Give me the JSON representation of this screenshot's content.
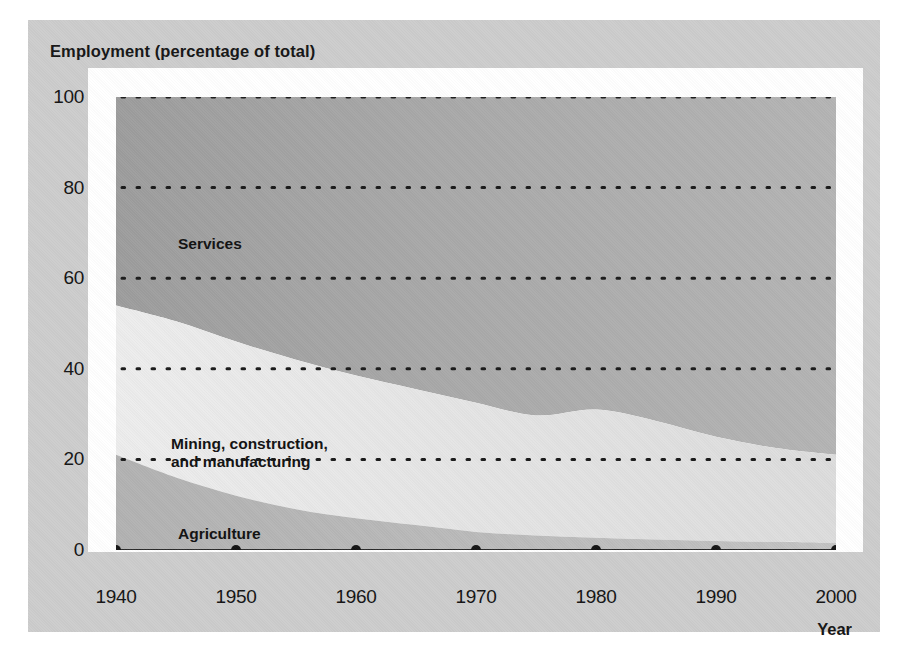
{
  "figure": {
    "y_axis_title": "Employment (percentage of total)",
    "x_axis_title": "Year"
  },
  "labels": {
    "services": "Services",
    "mining": "Mining, construction,\nand manufacturing",
    "agriculture": "Agriculture"
  },
  "colors": {
    "panel_background": "#cdcdcd",
    "plot_background": "#ffffff",
    "services_fill": "#a8a8a8",
    "mining_fill": "#e6e6e6",
    "agriculture_fill": "#bdbdbd",
    "gridline": "#1a1a1a",
    "text": "#141414"
  },
  "chart_data": {
    "type": "area",
    "stacked": true,
    "title": "",
    "xlabel": "Year",
    "ylabel": "Employment (percentage of total)",
    "xlim": [
      1940,
      2000
    ],
    "ylim": [
      0,
      100
    ],
    "grid": true,
    "legend_position": "inline-labels",
    "x": [
      1940,
      1945,
      1950,
      1955,
      1960,
      1965,
      1970,
      1975,
      1980,
      1985,
      1990,
      1995,
      2000
    ],
    "xticks": [
      1940,
      1950,
      1960,
      1970,
      1980,
      1990,
      2000
    ],
    "yticks": [
      0,
      20,
      40,
      60,
      80,
      100
    ],
    "series": [
      {
        "name": "Agriculture",
        "values": [
          21,
          16,
          12,
          9,
          7,
          5.5,
          4,
          3.2,
          2.7,
          2.3,
          2,
          1.8,
          1.6
        ]
      },
      {
        "name": "Mining, construction, and manufacturing",
        "values": [
          33,
          34.5,
          34,
          33,
          31.5,
          30,
          28.5,
          26.5,
          28.3,
          26.2,
          23,
          20.7,
          19.4
        ]
      },
      {
        "name": "Services",
        "values": [
          46,
          49.5,
          54,
          58,
          61.5,
          64.5,
          67.5,
          70.3,
          69,
          71.5,
          75,
          77.5,
          79
        ]
      }
    ],
    "cumulative_upper_bounds": {
      "agriculture": [
        21,
        16,
        12,
        9,
        7,
        5.5,
        4,
        3.2,
        2.7,
        2.3,
        2,
        1.8,
        1.6
      ],
      "agriculture_plus_mining": [
        54,
        50.5,
        46,
        42,
        38.5,
        35.5,
        32.5,
        29.7,
        31,
        28.5,
        25,
        22.5,
        21
      ],
      "total": [
        100,
        100,
        100,
        100,
        100,
        100,
        100,
        100,
        100,
        100,
        100,
        100,
        100
      ]
    },
    "xtick_markers": "filled-dots-on-zero-axis"
  }
}
